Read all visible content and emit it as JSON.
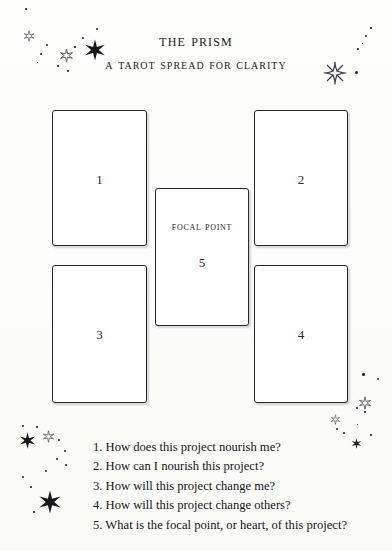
{
  "header": {
    "title": "The Prism",
    "subtitle": "A Tarot Spread for Clarity"
  },
  "cards": [
    {
      "id": "card-1",
      "number": "1",
      "label": ""
    },
    {
      "id": "card-2",
      "number": "2",
      "label": ""
    },
    {
      "id": "card-3",
      "number": "3",
      "label": ""
    },
    {
      "id": "card-4",
      "number": "4",
      "label": ""
    },
    {
      "id": "card-5",
      "number": "5",
      "label": "Focal Point"
    }
  ],
  "legend": {
    "lines": [
      "1. How does this project nourish me?",
      "2. How can I nourish this project?",
      "3. How will this project change me?",
      "4. How will this project change others?",
      "5. What is the focal point, or heart, of this project?"
    ]
  },
  "colors": {
    "ink": "#15151a",
    "card_border": "#26262b",
    "card_fill": "#ffffff",
    "paper": "#fdfdfb",
    "star": "#1a1a20"
  },
  "decorations": {
    "top_left_cluster": "stars-and-dots",
    "top_right_cluster": "sunburst-star-and-dots",
    "bottom_left_cluster": "stars-and-dots",
    "right_cluster": "small-stars-and-dots"
  }
}
